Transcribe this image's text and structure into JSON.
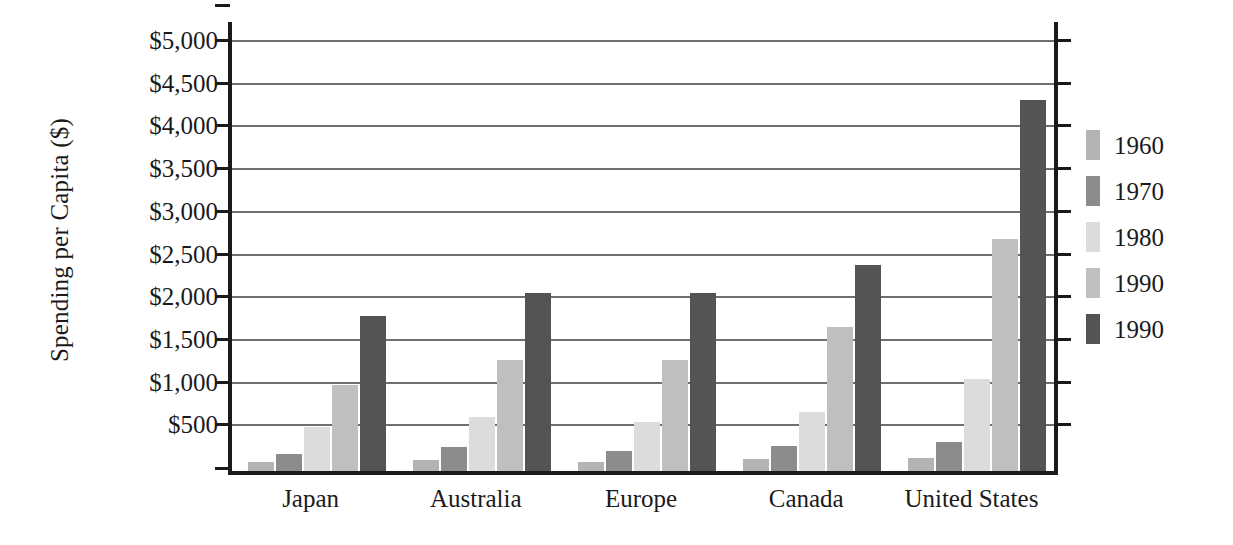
{
  "chart_data": {
    "type": "bar",
    "title": "",
    "xlabel": "",
    "ylabel": "Spending per Capita ($)",
    "ylim": [
      0,
      5000
    ],
    "ytick_step": 500,
    "grid": true,
    "legend_position": "right",
    "categories": [
      "Japan",
      "Australia",
      "Europe",
      "Canada",
      "United States"
    ],
    "ytick_labels": [
      "$5,000",
      "$4,500",
      "$4,000",
      "$3,500",
      "$3,000",
      "$2,500",
      "$2,000",
      "$1,500",
      "$1,000",
      "$500"
    ],
    "ytick_values": [
      5000,
      4500,
      4000,
      3500,
      3000,
      2500,
      2000,
      1500,
      1000,
      500
    ],
    "series": [
      {
        "name": "1960",
        "color": "#b4b4b4",
        "values": [
          100,
          130,
          110,
          140,
          150
        ]
      },
      {
        "name": "1970",
        "color": "#8c8c8c",
        "values": [
          200,
          280,
          240,
          290,
          340
        ]
      },
      {
        "name": "1980",
        "color": "#dcdcdc",
        "values": [
          520,
          630,
          570,
          690,
          1080
        ]
      },
      {
        "name": "1990",
        "color": "#bfbfbf",
        "values": [
          1010,
          1300,
          1300,
          1690,
          2720
        ]
      },
      {
        "name": "1990",
        "color": "#545454",
        "values": [
          1820,
          2090,
          2090,
          2410,
          4350
        ]
      }
    ]
  },
  "legend": {
    "items": [
      {
        "label": "1960",
        "color": "#b4b4b4"
      },
      {
        "label": "1970",
        "color": "#8c8c8c"
      },
      {
        "label": "1980",
        "color": "#dcdcdc"
      },
      {
        "label": "1990",
        "color": "#bfbfbf"
      },
      {
        "label": "1990",
        "color": "#545454"
      }
    ]
  },
  "axis": {
    "y_title": "Spending per Capita ($)"
  }
}
